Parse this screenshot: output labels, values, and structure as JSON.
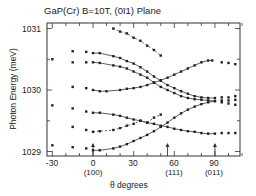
{
  "chart_data": {
    "type": "scatter",
    "title": "GaP(Cr) B=10T, (0ī1) Plane",
    "xlabel": "θ  degrees",
    "ylabel": "Photon Energy (meV)",
    "xlim": [
      -35,
      110
    ],
    "ylim": [
      1028.95,
      1031.1
    ],
    "x_ticks": [
      -30,
      0,
      30,
      60,
      90
    ],
    "x_tick_labels": [
      "-30",
      "0",
      "30",
      "60",
      "90"
    ],
    "x_sublabels": [
      {
        "x": 0,
        "label": "(100)"
      },
      {
        "x": 60,
        "label": "(111)"
      },
      {
        "x": 90,
        "label": "(011)"
      }
    ],
    "y_ticks": [
      1029,
      1030,
      1031
    ],
    "y_tick_labels": [
      "1029",
      "1030",
      "1031"
    ],
    "arrows_at_x": [
      0,
      55,
      90
    ],
    "grid": false,
    "legend": null,
    "series": [
      {
        "name": "branch-1",
        "style": "dashed-fit",
        "x": [
          15,
          20,
          25,
          30,
          35,
          40,
          45,
          50
        ],
        "y": [
          1031.0,
          1030.95,
          1030.92,
          1030.85,
          1030.8,
          1030.72,
          1030.65,
          1030.56
        ]
      },
      {
        "name": "branch-2",
        "style": "solid-fit",
        "x": [
          -15,
          -5,
          0,
          5,
          15,
          20,
          25,
          30,
          35,
          40,
          45,
          50,
          55,
          60,
          65,
          70,
          75,
          80,
          85,
          90,
          95,
          100,
          105
        ],
        "y": [
          1030.63,
          1030.62,
          1030.6,
          1030.6,
          1030.55,
          1030.52,
          1030.47,
          1030.43,
          1030.37,
          1030.3,
          1030.22,
          1030.15,
          1030.08,
          1030.03,
          1029.98,
          1029.94,
          1029.9,
          1029.88,
          1029.87,
          1029.87,
          1029.88,
          1029.88,
          1029.9
        ]
      },
      {
        "name": "branch-3",
        "style": "solid-fit",
        "x": [
          -30,
          -15,
          -5,
          0,
          5,
          15,
          20,
          25,
          30,
          35,
          40,
          45,
          50,
          55,
          60,
          65,
          70,
          75,
          80,
          85,
          90,
          95,
          100,
          105
        ],
        "y": [
          1030.5,
          1030.45,
          1030.45,
          1030.45,
          1030.44,
          1030.4,
          1030.38,
          1030.35,
          1030.3,
          1030.25,
          1030.2,
          1030.12,
          1030.05,
          1030.0,
          1029.95,
          1029.9,
          1029.87,
          1029.85,
          1029.84,
          1029.83,
          1029.82,
          1029.83,
          1029.83,
          1029.84
        ]
      },
      {
        "name": "branch-4",
        "style": "solid-fit",
        "x": [
          -15,
          -5,
          0,
          5,
          10,
          20,
          25,
          30,
          35,
          40,
          45,
          50,
          55,
          60,
          65,
          70,
          75,
          80,
          85,
          88,
          95,
          100,
          105
        ],
        "y": [
          1030.05,
          1030.03,
          1030.0,
          1029.98,
          1029.98,
          1030.0,
          1030.02,
          1030.03,
          1030.05,
          1030.08,
          1030.12,
          1030.16,
          1030.2,
          1030.25,
          1030.3,
          1030.35,
          1030.4,
          1030.45,
          1030.48,
          1030.48,
          1030.45,
          1030.44,
          1030.42
        ]
      },
      {
        "name": "branch-5",
        "style": "solid-fit",
        "x": [
          -30,
          -15,
          -5,
          0,
          5,
          15,
          20,
          25,
          30,
          35,
          40,
          45,
          50,
          55,
          60,
          65,
          70,
          75,
          80,
          85,
          90,
          95,
          100,
          105
        ],
        "y": [
          1029.75,
          1029.7,
          1029.65,
          1029.63,
          1029.63,
          1029.6,
          1029.58,
          1029.55,
          1029.52,
          1029.5,
          1029.47,
          1029.45,
          1029.42,
          1029.4,
          1029.37,
          1029.35,
          1029.33,
          1029.32,
          1029.3,
          1029.29,
          1029.29,
          1029.3,
          1029.3,
          1029.3
        ]
      },
      {
        "name": "branch-6",
        "style": "dashed-fit",
        "x": [
          -15,
          -5,
          0,
          5,
          15,
          20,
          25,
          30,
          35,
          40,
          45,
          50
        ],
        "y": [
          1029.4,
          1029.35,
          1029.32,
          1029.33,
          1029.35,
          1029.38,
          1029.42,
          1029.45,
          1029.5,
          1029.47,
          1029.55,
          1029.6
        ]
      },
      {
        "name": "branch-7",
        "style": "solid-fit",
        "x": [
          -30,
          -15,
          -5,
          0,
          5,
          15,
          20,
          25,
          30,
          35,
          40,
          45,
          50,
          55,
          60,
          65,
          70,
          75,
          80,
          85,
          90,
          95,
          100,
          105
        ],
        "y": [
          1029.1,
          1029.07,
          1029.05,
          1029.02,
          1029.02,
          1029.05,
          1029.08,
          1029.12,
          1029.17,
          1029.22,
          1029.27,
          1029.33,
          1029.4,
          1029.47,
          1029.55,
          1029.62,
          1029.68,
          1029.73,
          1029.77,
          1029.8,
          1029.82,
          1029.8,
          1029.78,
          1029.76
        ]
      }
    ]
  },
  "labels": {
    "title": "GaP(Cr)  B=10T,   (0ī1) Plane",
    "ylabel": "Photon  Energy  (meV)",
    "xlabel": "θ    degrees",
    "yticks": [
      "1031",
      "1030",
      "1029"
    ],
    "xticks": [
      "-30",
      "0",
      "30",
      "60",
      "90"
    ],
    "xsub": [
      "(100)",
      "(111)",
      "(011)"
    ]
  }
}
